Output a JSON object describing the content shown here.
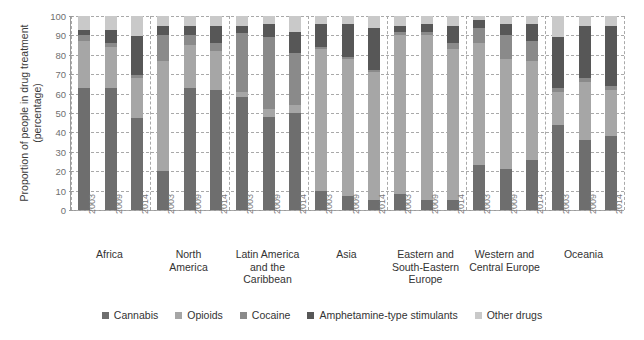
{
  "chart_data": {
    "type": "bar",
    "subtype": "stacked-bar-100-percent",
    "title": "",
    "xlabel": "",
    "ylabel": "Proportion of people in drug treatment (percentage)",
    "ylim": [
      0,
      100
    ],
    "yticks": [
      0,
      10,
      20,
      30,
      40,
      50,
      60,
      70,
      80,
      90,
      100
    ],
    "grid": true,
    "legend_position": "bottom",
    "categories": [
      "2003",
      "2009",
      "2014"
    ],
    "groups": [
      "Africa",
      "North America",
      "Latin America and the Caribbean",
      "Asia",
      "Eastern and South-Eastern Europe",
      "Western and Central Europe",
      "Oceania"
    ],
    "series": [
      {
        "name": "Cannabis",
        "color": "#6e6e6e",
        "values_by_group": {
          "Africa": [
            63,
            63,
            60
          ],
          "North America": [
            20,
            63,
            62
          ],
          "Latin America and the Caribbean": [
            58,
            48,
            50
          ],
          "Asia": [
            10,
            7,
            5
          ],
          "Eastern and South-Eastern Europe": [
            8,
            5,
            5
          ],
          "Western and Central Europe": [
            23,
            21,
            26
          ],
          "Oceania": [
            44,
            36,
            38
          ]
        }
      },
      {
        "name": "Opioids",
        "color": "#a6a6a6",
        "values_by_group": {
          "Africa": [
            24,
            21,
            26
          ],
          "North America": [
            57,
            22,
            20
          ],
          "Latin America and the Caribbean": [
            3,
            4,
            4
          ],
          "Asia": [
            73,
            71,
            66
          ],
          "Eastern and South-Eastern Europe": [
            82,
            85,
            78
          ],
          "Western and Central Europe": [
            63,
            57,
            51
          ],
          "Oceania": [
            17,
            30,
            24
          ]
        }
      },
      {
        "name": "Cocaine",
        "color": "#8a8a8a",
        "values_by_group": {
          "Africa": [
            3,
            2,
            2
          ],
          "North America": [
            13,
            5,
            4
          ],
          "Latin America and the Caribbean": [
            30,
            37,
            27
          ],
          "Asia": [
            1,
            1,
            1
          ],
          "Eastern and South-Eastern Europe": [
            2,
            2,
            3
          ],
          "Western and Central Europe": [
            8,
            12,
            10
          ],
          "Oceania": [
            2,
            2,
            2
          ]
        }
      },
      {
        "name": "Amphetamine-type stimulants",
        "color": "#575757",
        "values_by_group": {
          "Africa": [
            3,
            7,
            25
          ],
          "North America": [
            5,
            5,
            9
          ],
          "Latin America and the Caribbean": [
            4,
            7,
            11
          ],
          "Asia": [
            12,
            17,
            22
          ],
          "Eastern and South-Eastern Europe": [
            3,
            4,
            9
          ],
          "Western and Central Europe": [
            4,
            6,
            9
          ],
          "Oceania": [
            26,
            27,
            31
          ]
        }
      },
      {
        "name": "Other drugs",
        "color": "#c9c9c9",
        "values_by_group": {
          "Africa": [
            7,
            7,
            13
          ],
          "North America": [
            5,
            5,
            5
          ],
          "Latin America and the Caribbean": [
            5,
            4,
            8
          ],
          "Asia": [
            4,
            4,
            6
          ],
          "Eastern and South-Eastern Europe": [
            5,
            4,
            5
          ],
          "Western and Central Europe": [
            2,
            4,
            4
          ],
          "Oceania": [
            11,
            5,
            5
          ]
        }
      }
    ]
  },
  "axis": {
    "y_title": "Proportion of people in drug treatment (percentage)",
    "y_tick_labels": [
      "100",
      "90",
      "80",
      "70",
      "60",
      "50",
      "40",
      "30",
      "20",
      "10",
      "0"
    ]
  },
  "legend": {
    "items": [
      {
        "label": "Cannabis",
        "color": "#6e6e6e"
      },
      {
        "label": "Opioids",
        "color": "#a6a6a6"
      },
      {
        "label": "Cocaine",
        "color": "#8a8a8a"
      },
      {
        "label": "Amphetamine-type stimulants",
        "color": "#575757"
      },
      {
        "label": "Other drugs",
        "color": "#c9c9c9"
      }
    ]
  },
  "regions": [
    {
      "name": "Africa",
      "lines": [
        "Africa"
      ]
    },
    {
      "name": "North America",
      "lines": [
        "North",
        "America"
      ]
    },
    {
      "name": "Latin America and the Caribbean",
      "lines": [
        "Latin America",
        "and the",
        "Caribbean"
      ]
    },
    {
      "name": "Asia",
      "lines": [
        "Asia"
      ]
    },
    {
      "name": "Eastern and South-Eastern Europe",
      "lines": [
        "Eastern and",
        "South-Eastern",
        "Europe"
      ]
    },
    {
      "name": "Western and Central Europe",
      "lines": [
        "Western and",
        "Central Europe"
      ]
    },
    {
      "name": "Oceania",
      "lines": [
        "Oceania"
      ]
    }
  ],
  "years": [
    "2003",
    "2009",
    "2014"
  ]
}
